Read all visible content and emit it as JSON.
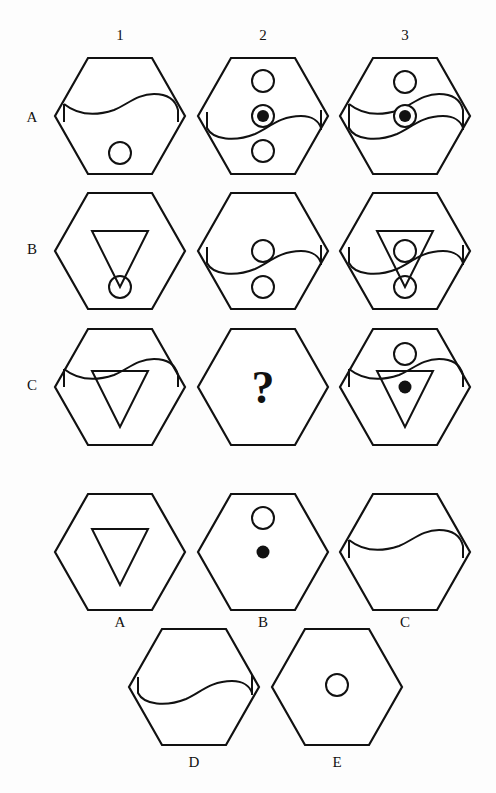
{
  "puzzle": {
    "column_headers": [
      "1",
      "2",
      "3"
    ],
    "row_labels": [
      "A",
      "B",
      "C"
    ],
    "missing_marker": "?",
    "grid": [
      {
        "row": "A",
        "col": "1",
        "elements": [
          "wave-line",
          "circle-bottom"
        ]
      },
      {
        "row": "A",
        "col": "2",
        "elements": [
          "circle-top",
          "target-dot-center",
          "wave-line-flipped",
          "circle-bottom"
        ]
      },
      {
        "row": "A",
        "col": "3",
        "elements": [
          "circle-top",
          "target-dot-center",
          "wave-line",
          "wave-line-flipped"
        ]
      },
      {
        "row": "B",
        "col": "1",
        "elements": [
          "triangle-down",
          "circle-bottom"
        ]
      },
      {
        "row": "B",
        "col": "2",
        "elements": [
          "wave-line-flipped",
          "circle-center",
          "circle-bottom"
        ]
      },
      {
        "row": "B",
        "col": "3",
        "elements": [
          "triangle-down",
          "wave-line-flipped",
          "circle-center",
          "circle-bottom"
        ]
      },
      {
        "row": "C",
        "col": "1",
        "elements": [
          "wave-line",
          "triangle-down"
        ]
      },
      {
        "row": "C",
        "col": "2",
        "elements": [
          "?"
        ]
      },
      {
        "row": "C",
        "col": "3",
        "elements": [
          "circle-top",
          "wave-line",
          "triangle-down",
          "dot-center"
        ]
      }
    ]
  },
  "answers": [
    {
      "label": "A",
      "elements": [
        "triangle-down"
      ]
    },
    {
      "label": "B",
      "elements": [
        "circle-top",
        "dot-center"
      ]
    },
    {
      "label": "C",
      "elements": [
        "wave-line"
      ]
    },
    {
      "label": "D",
      "elements": [
        "wave-line-flipped"
      ]
    },
    {
      "label": "E",
      "elements": [
        "circle-center"
      ]
    }
  ],
  "colors": {
    "ink": "#111111",
    "background": "#fdfdfd"
  }
}
